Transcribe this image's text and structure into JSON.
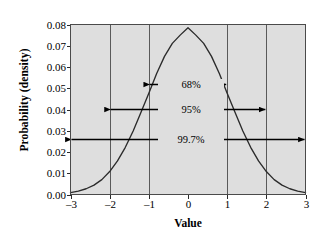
{
  "figure": {
    "width": 332,
    "height": 248,
    "page_background": "#ffffff",
    "plot_background": "#dedede",
    "plot_border_color": "#4a4a4a",
    "gridline_color": "#5a5a5a",
    "curve_color": "#2b2b2b",
    "annotation_color": "#000000"
  },
  "chart_data": {
    "type": "line",
    "title": "",
    "subtitle": "",
    "xlabel": "Value",
    "ylabel": "Probability (density)",
    "xlim": [
      -3,
      3
    ],
    "ylim": [
      0,
      0.08
    ],
    "xticks": [
      -3,
      -2,
      -1,
      0,
      1,
      2,
      3
    ],
    "xticklabels": [
      "–3",
      "–2",
      "–1",
      "0",
      "1",
      "2",
      "3"
    ],
    "yticks": [
      0.0,
      0.01,
      0.02,
      0.03,
      0.04,
      0.05,
      0.06,
      0.07,
      0.08
    ],
    "yticklabels": [
      "0.00",
      "0.01",
      "0.02",
      "0.03",
      "0.04",
      "0.05",
      "0.06",
      "0.07",
      "0.08"
    ],
    "grid": {
      "vertical": true,
      "horizontal": false,
      "vertical_at": [
        -2,
        -1,
        1,
        2
      ]
    },
    "legend": null,
    "series": [
      {
        "name": "Normal density",
        "description": "Bell-shaped normal probability density curve, peak near x = 0 at about 0.0785",
        "x": [
          -3.0,
          -2.8,
          -2.6,
          -2.4,
          -2.2,
          -2.0,
          -1.8,
          -1.6,
          -1.4,
          -1.2,
          -1.0,
          -0.8,
          -0.6,
          -0.4,
          -0.2,
          0.0,
          0.2,
          0.4,
          0.6,
          0.8,
          1.0,
          1.2,
          1.4,
          1.6,
          1.8,
          2.0,
          2.2,
          2.4,
          2.6,
          2.8,
          3.0
        ],
        "y": [
          0.0009,
          0.0016,
          0.0027,
          0.0044,
          0.007,
          0.0108,
          0.0158,
          0.0222,
          0.0299,
          0.0387,
          0.0476,
          0.0569,
          0.065,
          0.0711,
          0.075,
          0.0785,
          0.075,
          0.0711,
          0.065,
          0.0569,
          0.0476,
          0.0387,
          0.0299,
          0.0222,
          0.0158,
          0.0108,
          0.007,
          0.0044,
          0.0027,
          0.0016,
          0.0009
        ]
      }
    ],
    "annotations": [
      {
        "label": "68%",
        "kind": "double-headed-arrow",
        "x_start": -1,
        "x_end": 1,
        "y": 0.052
      },
      {
        "label": "95%",
        "kind": "double-headed-arrow",
        "x_start": -2,
        "x_end": 2,
        "y": 0.0402
      },
      {
        "label": "99.7%",
        "kind": "double-headed-arrow",
        "x_start": -3,
        "x_end": 3,
        "y": 0.0262
      }
    ]
  }
}
